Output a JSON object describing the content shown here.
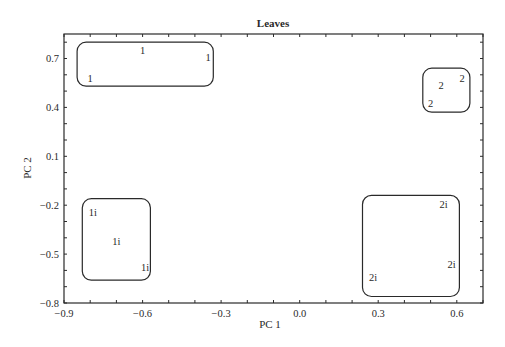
{
  "chart_data": {
    "type": "scatter",
    "title": "Leaves",
    "xlabel": "PC 1",
    "ylabel": "PC 2",
    "xlim": [
      -0.9,
      0.7
    ],
    "ylim": [
      -0.8,
      0.85
    ],
    "grid": false,
    "legend": "none",
    "xticks": [
      -0.9,
      -0.6,
      -0.3,
      0.0,
      0.3,
      0.6
    ],
    "xtick_labels": [
      "−0.9",
      "−0.6",
      "−0.3",
      "0.0",
      "0.3",
      "0.6"
    ],
    "yticks": [
      -0.8,
      -0.5,
      -0.2,
      0.1,
      0.4,
      0.7
    ],
    "ytick_labels": [
      "−0.8",
      "−0.5",
      "−0.2",
      "0.1",
      "0.4",
      "0.7"
    ],
    "minor_tick_step": 0.1,
    "series": [
      {
        "name": "1",
        "points": [
          {
            "x": -0.8,
            "y": 0.58
          },
          {
            "x": -0.6,
            "y": 0.75
          },
          {
            "x": -0.35,
            "y": 0.71
          }
        ]
      },
      {
        "name": "2",
        "points": [
          {
            "x": 0.54,
            "y": 0.54
          },
          {
            "x": 0.62,
            "y": 0.58
          },
          {
            "x": 0.5,
            "y": 0.43
          }
        ]
      },
      {
        "name": "1i",
        "points": [
          {
            "x": -0.79,
            "y": -0.24
          },
          {
            "x": -0.7,
            "y": -0.42
          },
          {
            "x": -0.59,
            "y": -0.58
          }
        ]
      },
      {
        "name": "2i",
        "points": [
          {
            "x": 0.55,
            "y": -0.19
          },
          {
            "x": 0.58,
            "y": -0.56
          },
          {
            "x": 0.28,
            "y": -0.64
          }
        ]
      }
    ],
    "group_enclosures": [
      {
        "name": "1",
        "x0": -0.85,
        "x1": -0.33,
        "y0": 0.53,
        "y1": 0.8
      },
      {
        "name": "2",
        "x0": 0.47,
        "x1": 0.65,
        "y0": 0.37,
        "y1": 0.64
      },
      {
        "name": "1i",
        "x0": -0.83,
        "x1": -0.57,
        "y0": -0.66,
        "y1": -0.16
      },
      {
        "name": "2i",
        "x0": 0.24,
        "x1": 0.61,
        "y0": -0.76,
        "y1": -0.14
      }
    ]
  },
  "colors": {
    "line": "#2a2a2a",
    "text": "#2a2a2a",
    "background": "#ffffff"
  }
}
